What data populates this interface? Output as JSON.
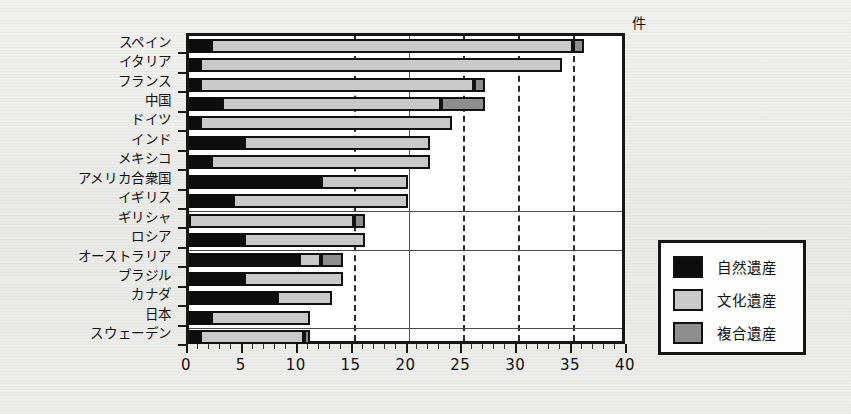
{
  "chart_data": {
    "type": "bar",
    "orientation": "horizontal",
    "stacked": true,
    "title": "",
    "xlabel": "件",
    "ylabel": "",
    "xlim": [
      0,
      40
    ],
    "xticks": [
      0,
      5,
      10,
      15,
      20,
      25,
      30,
      35,
      40
    ],
    "xtick_labels": [
      "0",
      "5",
      "10",
      "15",
      "20",
      "25",
      "30",
      "35",
      "40"
    ],
    "grid": "vertical dashed at 15, 25, 30, 35; solid at 20",
    "legend_position": "right-outside",
    "categories": [
      "スペイン",
      "イタリア",
      "フランス",
      "中国",
      "ドイツ",
      "インド",
      "メキシコ",
      "アメリカ合衆国",
      "イギリス",
      "ギリシャ",
      "ロシア",
      "オーストラリア",
      "ブラジル",
      "カナダ",
      "日本",
      "スウェーデン"
    ],
    "series": [
      {
        "name": "自然遺産",
        "color": "#0d0d0d",
        "values": [
          2,
          1,
          1,
          3,
          1,
          5,
          2,
          12,
          4,
          0,
          5,
          10,
          5,
          8,
          2,
          1
        ]
      },
      {
        "name": "文化遺産",
        "color": "#c9c9c9",
        "values": [
          33,
          33,
          25,
          20,
          23,
          17,
          20,
          8,
          16,
          15,
          11,
          2,
          9,
          5,
          9,
          9.5
        ]
      },
      {
        "name": "複合遺産",
        "color": "#8e8e8e",
        "values": [
          1,
          0,
          1,
          4,
          0,
          0,
          0,
          0,
          0,
          1,
          0,
          2,
          0,
          0,
          0,
          0.5
        ]
      }
    ],
    "totals": [
      36,
      34,
      27,
      27,
      24,
      22,
      22,
      20,
      20,
      16,
      16,
      14,
      14,
      13,
      11,
      11
    ]
  },
  "legend": {
    "items": [
      {
        "label": "自然遺産",
        "swatch": "nat"
      },
      {
        "label": "文化遺産",
        "swatch": "cul"
      },
      {
        "label": "複合遺産",
        "swatch": "mix"
      }
    ]
  },
  "axis": {
    "unit_label": "件"
  }
}
